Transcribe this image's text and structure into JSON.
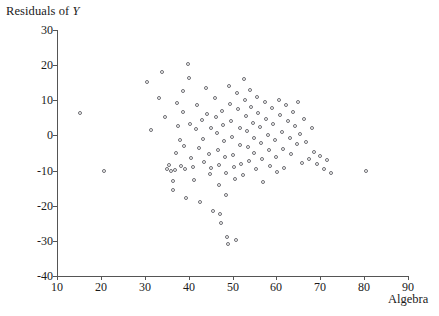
{
  "chart_data": {
    "type": "scatter",
    "title": "",
    "xlabel": "Algebra",
    "ylabel_prefix": "Residuals of ",
    "ylabel_italic": "Y",
    "ylabel": "Residuals of Y",
    "xlim": [
      10,
      90
    ],
    "ylim": [
      -40,
      30
    ],
    "xticks": [
      10,
      20,
      30,
      40,
      50,
      60,
      70,
      80,
      90
    ],
    "yticks": [
      30,
      20,
      10,
      0,
      -10,
      -20,
      -30,
      -40
    ],
    "xtick_labels": [
      "10",
      "20",
      "30",
      "40",
      "50",
      "60",
      "70",
      "80",
      "90"
    ],
    "ytick_labels": [
      "30",
      "20",
      "10",
      "0",
      "-10",
      "-20",
      "-30",
      "-40"
    ],
    "grid": false,
    "legend": false,
    "marker": "open-circle",
    "marker_color": "#6d6d72",
    "n_points": 128,
    "points": [
      [
        15.2,
        6.3
      ],
      [
        20.8,
        -10.0
      ],
      [
        30.6,
        15.2
      ],
      [
        31.3,
        1.5
      ],
      [
        33.2,
        10.6
      ],
      [
        34.0,
        18.2
      ],
      [
        34.6,
        5.4
      ],
      [
        35.0,
        -9.6
      ],
      [
        35.6,
        -8.3
      ],
      [
        36.0,
        -10.2
      ],
      [
        36.4,
        -13.0
      ],
      [
        36.5,
        -15.5
      ],
      [
        36.8,
        -9.8
      ],
      [
        37.0,
        -5.0
      ],
      [
        37.4,
        9.2
      ],
      [
        37.6,
        2.6
      ],
      [
        38.0,
        -1.2
      ],
      [
        38.3,
        -8.6
      ],
      [
        38.6,
        12.6
      ],
      [
        38.8,
        6.8
      ],
      [
        39.0,
        -3.0
      ],
      [
        39.2,
        -9.4
      ],
      [
        39.5,
        -17.8
      ],
      [
        39.8,
        20.2
      ],
      [
        40.0,
        16.3
      ],
      [
        40.2,
        3.2
      ],
      [
        40.6,
        -6.4
      ],
      [
        41.0,
        -9.0
      ],
      [
        41.3,
        -12.8
      ],
      [
        41.6,
        1.8
      ],
      [
        42.0,
        8.6
      ],
      [
        42.3,
        -3.6
      ],
      [
        42.6,
        -19.0
      ],
      [
        43.0,
        4.4
      ],
      [
        43.3,
        -1.0
      ],
      [
        43.6,
        -7.6
      ],
      [
        44.0,
        13.4
      ],
      [
        44.2,
        6.0
      ],
      [
        44.6,
        -5.2
      ],
      [
        44.8,
        -11.0
      ],
      [
        45.0,
        2.2
      ],
      [
        45.2,
        -9.2
      ],
      [
        45.6,
        -21.6
      ],
      [
        46.0,
        10.6
      ],
      [
        46.2,
        5.2
      ],
      [
        46.4,
        0.6
      ],
      [
        46.6,
        -4.0
      ],
      [
        46.8,
        -8.4
      ],
      [
        47.0,
        -14.2
      ],
      [
        47.2,
        -22.4
      ],
      [
        47.4,
        -25.0
      ],
      [
        47.6,
        7.0
      ],
      [
        47.8,
        3.0
      ],
      [
        48.0,
        -1.6
      ],
      [
        48.2,
        -6.2
      ],
      [
        48.4,
        -10.8
      ],
      [
        48.6,
        -17.0
      ],
      [
        48.8,
        -28.8
      ],
      [
        49.0,
        -31.0
      ],
      [
        49.2,
        14.0
      ],
      [
        49.4,
        9.0
      ],
      [
        49.6,
        4.2
      ],
      [
        49.8,
        -0.4
      ],
      [
        50.0,
        -5.6
      ],
      [
        50.3,
        -9.0
      ],
      [
        50.6,
        -12.4
      ],
      [
        50.8,
        -29.6
      ],
      [
        51.0,
        12.2
      ],
      [
        51.3,
        7.4
      ],
      [
        51.6,
        2.0
      ],
      [
        51.8,
        -2.8
      ],
      [
        52.0,
        -8.0
      ],
      [
        52.3,
        -11.2
      ],
      [
        52.6,
        16.0
      ],
      [
        52.8,
        10.0
      ],
      [
        53.0,
        5.6
      ],
      [
        53.2,
        1.2
      ],
      [
        53.5,
        -3.4
      ],
      [
        53.8,
        -7.2
      ],
      [
        54.0,
        13.0
      ],
      [
        54.3,
        8.2
      ],
      [
        54.6,
        3.6
      ],
      [
        54.8,
        -0.8
      ],
      [
        55.0,
        -5.0
      ],
      [
        55.3,
        -9.6
      ],
      [
        55.6,
        11.0
      ],
      [
        55.9,
        6.4
      ],
      [
        56.2,
        2.4
      ],
      [
        56.5,
        -2.0
      ],
      [
        56.8,
        -6.6
      ],
      [
        57.0,
        -13.2
      ],
      [
        57.4,
        9.4
      ],
      [
        57.7,
        4.8
      ],
      [
        58.0,
        0.2
      ],
      [
        58.3,
        -4.2
      ],
      [
        58.6,
        -8.8
      ],
      [
        59.0,
        7.8
      ],
      [
        59.3,
        3.4
      ],
      [
        59.6,
        -1.4
      ],
      [
        59.9,
        -6.0
      ],
      [
        60.2,
        -10.4
      ],
      [
        60.5,
        10.2
      ],
      [
        60.8,
        5.8
      ],
      [
        61.2,
        1.0
      ],
      [
        61.5,
        -3.8
      ],
      [
        61.8,
        -9.2
      ],
      [
        62.2,
        8.8
      ],
      [
        62.6,
        4.0
      ],
      [
        63.0,
        -0.6
      ],
      [
        63.4,
        -5.4
      ],
      [
        63.8,
        6.6
      ],
      [
        64.2,
        2.8
      ],
      [
        64.6,
        -2.4
      ],
      [
        65.0,
        9.6
      ],
      [
        65.4,
        0.4
      ],
      [
        65.8,
        -7.8
      ],
      [
        66.3,
        4.6
      ],
      [
        66.8,
        -1.8
      ],
      [
        67.4,
        -6.8
      ],
      [
        68.0,
        2.0
      ],
      [
        68.6,
        -4.6
      ],
      [
        69.2,
        -8.2
      ],
      [
        70.0,
        -5.8
      ],
      [
        70.8,
        -9.4
      ],
      [
        71.6,
        -7.0
      ],
      [
        72.4,
        -10.6
      ],
      [
        80.5,
        -10.2
      ]
    ]
  }
}
